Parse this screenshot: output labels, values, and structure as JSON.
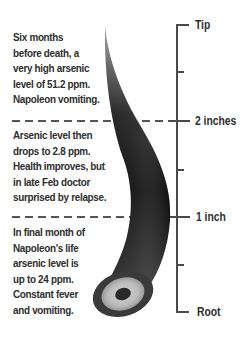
{
  "diagram": {
    "colors": {
      "text": "#2e2e2e",
      "scale_line": "#4a4a4a",
      "dashed_line": "#555555",
      "hair_dark": "#1a1a1a",
      "hair_mid": "#555555",
      "hair_tip": "#9a9a9a",
      "root_ring_light": "#bdbdbd",
      "root_core": "#2a2a2a"
    },
    "scale": {
      "labels": {
        "tip": "Tip",
        "two_inches": "2 inches",
        "one_inch": "1 inch",
        "root": "Root"
      }
    },
    "notes": [
      {
        "segment": "tip-to-2-inches",
        "lines": [
          "Six months",
          "before death, a",
          "very high arsenic",
          "level of 51.2 ppm.",
          "Napoleon vomiting."
        ]
      },
      {
        "segment": "2-inches-to-1-inch",
        "lines": [
          "Arsenic level then",
          "drops to 2.8 ppm.",
          "Health improves, but",
          "in late Feb doctor",
          "surprised by relapse."
        ]
      },
      {
        "segment": "1-inch-to-root",
        "lines": [
          "In final month of",
          "Napoleon's life",
          "arsenic level is",
          "up to 24 ppm.",
          "Constant fever",
          "and vomiting."
        ]
      }
    ]
  }
}
